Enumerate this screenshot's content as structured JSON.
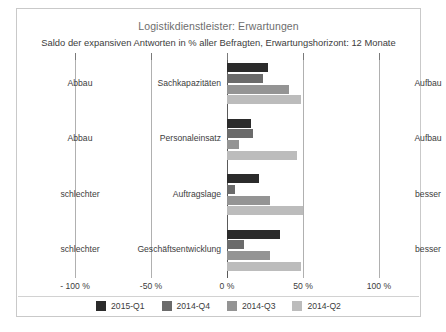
{
  "chart_data": {
    "type": "bar",
    "orientation": "horizontal",
    "title": "Logistikdienstleister: Erwartungen",
    "subtitle": "Saldo der expansiven Antworten in % aller Befragten, Erwartungshorizont: 12 Monate",
    "xlabel": "",
    "ylabel": "",
    "xlim": [
      -100,
      100
    ],
    "grid": true,
    "legend_position": "bottom",
    "tick_labels": [
      "- 100 %",
      "-50 %",
      "0 %",
      "50 %",
      "100 %"
    ],
    "tick_values": [
      -100,
      -50,
      0,
      50,
      100
    ],
    "categories": [
      "Sachkapazitäten",
      "Personaleinsatz",
      "Auftragslage",
      "Geschäftsentwicklung"
    ],
    "left_pole_labels": [
      "Abbau",
      "Abbau",
      "schlechter",
      "schlechter"
    ],
    "right_pole_labels": [
      "Aufbau",
      "Aufbau",
      "besser",
      "besser"
    ],
    "series": [
      {
        "name": "2015-Q1",
        "color": "#2b2b2b",
        "values": [
          27,
          16,
          21,
          35
        ]
      },
      {
        "name": "2014-Q4",
        "color": "#6b6b6b",
        "values": [
          24,
          17,
          5,
          11
        ]
      },
      {
        "name": "2014-Q3",
        "color": "#949494",
        "values": [
          41,
          8,
          28,
          28
        ]
      },
      {
        "name": "2014-Q2",
        "color": "#bcbcbc",
        "values": [
          49,
          46,
          50,
          49
        ]
      }
    ]
  }
}
